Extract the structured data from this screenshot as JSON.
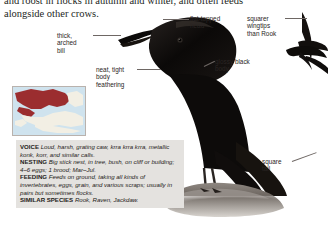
{
  "page": {
    "background_color": "#ffffff",
    "width": 328,
    "height": 226
  },
  "intro": {
    "line1": "and roost in flocks in autumn and winter, and often feeds",
    "line2": "alongside other crows."
  },
  "callouts": [
    {
      "id": "bill",
      "name": "thick-arched-bill-callout",
      "text": "thick,\narched\nbill"
    },
    {
      "id": "head",
      "name": "flat-topped-head-callout",
      "text": "flat-topped\nhead"
    },
    {
      "id": "body",
      "name": "glossy-black-body-callout",
      "text": "glossy black\nbody"
    },
    {
      "id": "feathering",
      "name": "body-feathering-callout",
      "text": "neat, tight\nbody\nfeathering"
    },
    {
      "id": "wingtips",
      "name": "squarer-wingtips-callout",
      "text": "squarer\nwingtips\nthan Rook"
    },
    {
      "id": "tail",
      "name": "square-tail-callout",
      "text": "square\ntail"
    }
  ],
  "map": {
    "label": "distribution-map",
    "sea_color": "#cfe3ee",
    "land_color": "#f2efe4",
    "range_color": "#9b2d2f"
  },
  "factbox": {
    "background_color": "#e4e2df",
    "entries": [
      {
        "key": "VOICE",
        "value": "Loud, harsh, grating caw, krra krra krra, metallic konk, korr, and similar calls."
      },
      {
        "key": "NESTING",
        "value": "Big stick nest, in tree, bush, on cliff or building; 4–6 eggs; 1 brood; Mar–Jul."
      },
      {
        "key": "FEEDING",
        "value": "Feeds on ground, taking all kinds of invertebrates, eggs, grain, and various scraps; usually in pairs but sometimes flocks."
      },
      {
        "key": "SIMILAR SPECIES",
        "value": "Rook, Raven, Jackdaw."
      }
    ]
  },
  "illustrations": [
    {
      "name": "crow-head-profile-illustration",
      "caption_less": true
    },
    {
      "name": "crow-flight-silhouette-illustration",
      "caption_less": true
    },
    {
      "name": "crow-perched-on-rock-illustration",
      "caption_less": true
    }
  ]
}
